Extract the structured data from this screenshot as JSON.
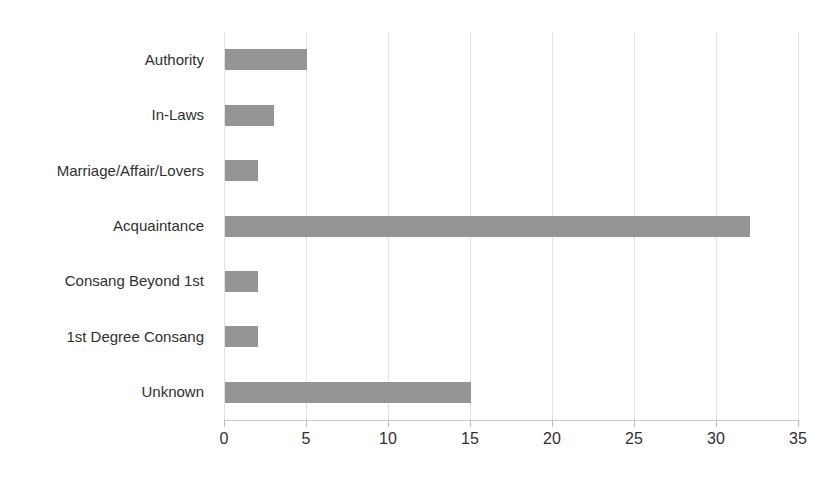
{
  "chart_data": {
    "type": "bar",
    "orientation": "horizontal",
    "title": "",
    "xlabel": "",
    "ylabel": "",
    "xlim": [
      0,
      35
    ],
    "xticks": [
      0,
      5,
      10,
      15,
      20,
      25,
      30,
      35
    ],
    "grid": true,
    "legend": false,
    "legend_position": "none",
    "bar_color": "#959595",
    "categories": [
      "Authority",
      "In-Laws",
      "Marriage/Affair/Lovers",
      "Acquaintance",
      "Consang Beyond 1st",
      "1st Degree Consang",
      "Unknown"
    ],
    "values": [
      5,
      3,
      2,
      32,
      2,
      2,
      15
    ],
    "series": [
      {
        "name": "Count",
        "values": [
          5,
          3,
          2,
          32,
          2,
          2,
          15
        ]
      }
    ]
  },
  "axis": {
    "tick_labels": [
      "0",
      "5",
      "10",
      "15",
      "20",
      "25",
      "30",
      "35"
    ]
  },
  "colors": {
    "bar": "#959595",
    "gridline": "#e2e2e2",
    "text": "#2f2f2f",
    "background": "#ffffff"
  },
  "header": {
    "title_fragment": ""
  }
}
